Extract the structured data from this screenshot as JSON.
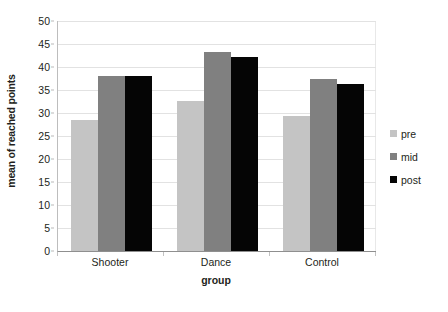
{
  "chart_data": {
    "type": "bar",
    "title": "",
    "xlabel": "group",
    "ylabel": "mean of reached points",
    "categories": [
      "Shooter",
      "Dance",
      "Control"
    ],
    "series": [
      {
        "name": "pre",
        "color": "#c4c4c4",
        "values": [
          28.4,
          32.7,
          29.4
        ]
      },
      {
        "name": "mid",
        "color": "#808080",
        "values": [
          38.0,
          43.3,
          37.4
        ]
      },
      {
        "name": "post",
        "color": "#050505",
        "values": [
          38.0,
          42.1,
          36.2
        ]
      }
    ],
    "ylim": [
      0,
      50
    ],
    "ytick_values": [
      0,
      5,
      10,
      15,
      20,
      25,
      30,
      35,
      40,
      45,
      50
    ],
    "ytick_labels": [
      "0",
      "5",
      "10",
      "15",
      "20",
      "25",
      "30",
      "35",
      "40",
      "45",
      "50"
    ],
    "grid": true,
    "legend_position": "right"
  }
}
